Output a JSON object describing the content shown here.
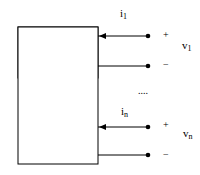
{
  "diagram": {
    "type": "multiport-network",
    "block": {
      "label": ""
    },
    "ports": [
      {
        "current": {
          "symbol": "i",
          "subscript": "1"
        },
        "voltage": {
          "symbol": "v",
          "subscript": "1"
        },
        "plus": "+",
        "minus": "−"
      },
      {
        "current": {
          "symbol": "i",
          "subscript": "n"
        },
        "voltage": {
          "symbol": "v",
          "subscript": "n"
        },
        "plus": "+",
        "minus": "−"
      }
    ],
    "ellipsis": "...."
  }
}
